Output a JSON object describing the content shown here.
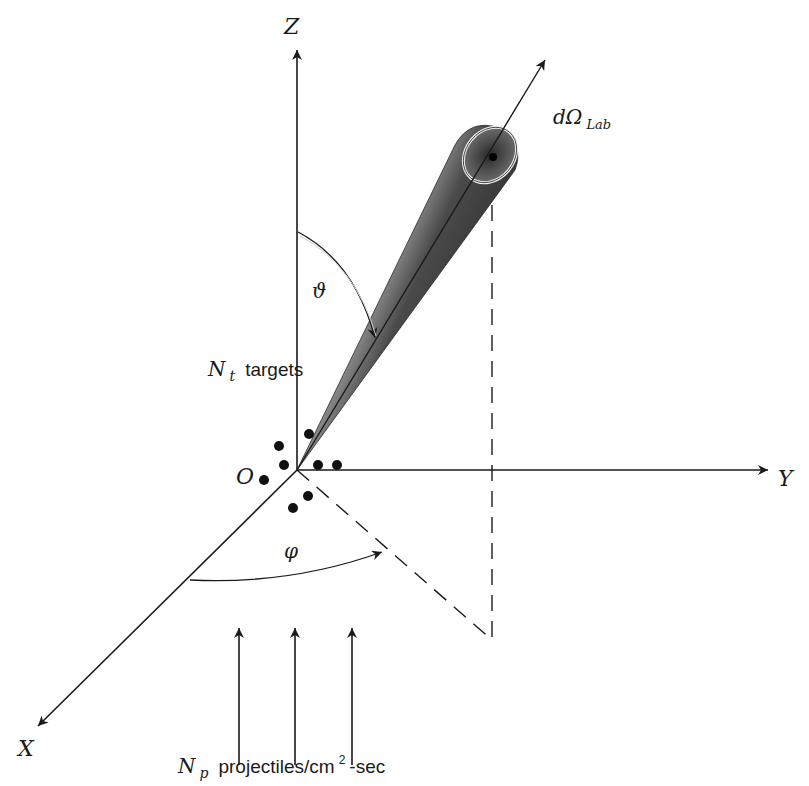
{
  "figure": {
    "type": "scattering-geometry-diagram",
    "axes": {
      "z_label": "Z",
      "y_label": "Y",
      "x_label": "X",
      "origin_label": "O"
    },
    "angles": {
      "polar_label": "ϑ",
      "azimuth_label": "φ"
    },
    "solid_angle": {
      "label_main": "dΩ",
      "label_sub": "Lab"
    },
    "targets": {
      "label_symbol": "N",
      "label_sub": "t",
      "label_text": "targets",
      "dot_count": 8
    },
    "projectiles": {
      "label_symbol": "N",
      "label_sub": "p",
      "label_text": "projectiles/cm",
      "label_sup": "2",
      "label_tail": "-sec",
      "arrow_count": 3
    },
    "colors": {
      "ink": "#1a1a1a",
      "background": "#ffffff",
      "cone_dark": "#3a3a3a",
      "cone_light": "#bdbdbd"
    }
  }
}
